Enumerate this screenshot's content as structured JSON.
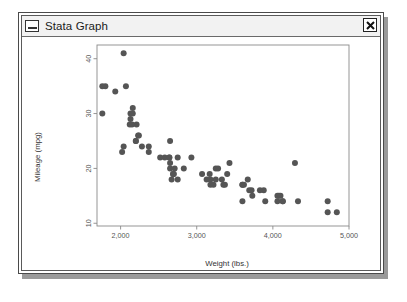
{
  "window": {
    "title": "Stata Graph",
    "sysmenu_icon": "minimize-box-icon",
    "close_icon": "close-x-icon",
    "close_label": "×"
  },
  "chart_data": {
    "type": "scatter",
    "title": "",
    "xlabel": "Weight (lbs.)",
    "ylabel": "Mileage (mpg)",
    "xlim": [
      1690,
      5000
    ],
    "ylim": [
      9.5,
      42.5
    ],
    "xticks": [
      2000,
      3000,
      4000,
      5000
    ],
    "xtick_labels": [
      "2,000",
      "3,000",
      "4,000",
      "5,000"
    ],
    "yticks": [
      10,
      20,
      30,
      40
    ],
    "ytick_labels": [
      "10",
      "20",
      "30",
      "40"
    ],
    "grid": false,
    "legend": "none",
    "marker": {
      "shape": "circle",
      "color": "#555555",
      "size": 3.0
    },
    "frame_color": "#8a8a8a",
    "n_points": 74,
    "series": [
      {
        "name": "mpg vs weight",
        "x": [
          2930,
          3350,
          2640,
          3250,
          4080,
          3670,
          2230,
          3280,
          3880,
          3400,
          4330,
          3900,
          4290,
          4720,
          3430,
          3600,
          3600,
          3600,
          4840,
          4720,
          3830,
          2580,
          2200,
          2520,
          3330,
          2130,
          2650,
          2690,
          3250,
          3730,
          2690,
          2370,
          2020,
          2280,
          2750,
          3170,
          2710,
          2750,
          2640,
          3180,
          2650,
          3690,
          3180,
          3220,
          4130,
          4060,
          4130,
          4060,
          3720,
          3370,
          3070,
          3620,
          3130,
          4100,
          2700,
          2120,
          2210,
          2070,
          2650,
          2200,
          2150,
          2670,
          2130,
          2160,
          2040,
          1800,
          1760,
          2240,
          1760,
          2040,
          1930,
          2160,
          2370,
          2830
        ],
        "y": [
          22,
          17,
          22,
          20,
          15,
          18,
          26,
          20,
          16,
          19,
          14,
          14,
          21,
          14,
          21,
          14,
          17,
          17,
          12,
          12,
          16,
          22,
          25,
          22,
          18,
          29,
          20,
          19,
          18,
          15,
          19,
          24,
          23,
          24,
          22,
          19,
          20,
          18,
          22,
          18,
          21,
          16,
          17,
          17,
          14,
          15,
          14,
          14,
          16,
          17,
          19,
          17,
          18,
          15,
          19,
          28,
          28,
          35,
          25,
          25,
          28,
          18,
          30,
          31,
          41,
          35,
          35,
          26,
          30,
          24,
          34,
          30,
          23,
          20
        ]
      }
    ]
  }
}
